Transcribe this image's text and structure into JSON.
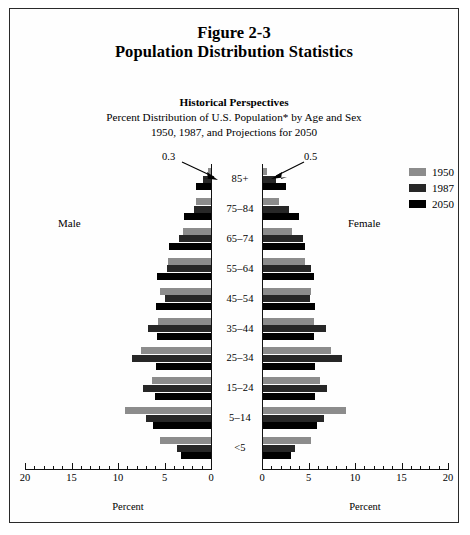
{
  "figure": {
    "title_line1": "Figure 2-3",
    "title_line2": "Population Distribution Statistics",
    "subtitle_strong": "Historical Perspectives",
    "subtitle_line2": "Percent Distribution of U.S. Population* by Age and Sex",
    "subtitle_line3": "1950, 1987, and Projections for 2050"
  },
  "labels": {
    "male": "Male",
    "female": "Female",
    "xaxis_left": "Percent",
    "xaxis_right": "Percent"
  },
  "legend": {
    "items": [
      {
        "label": "1950",
        "color": "#8c8c8c"
      },
      {
        "label": "1987",
        "color": "#272727"
      },
      {
        "label": "2050",
        "color": "#000000"
      }
    ]
  },
  "callouts": [
    {
      "name": "male-85plus-1950-value",
      "text": "0.3"
    },
    {
      "name": "female-85plus-1950-value",
      "text": "0.5"
    }
  ],
  "axis": {
    "tick_labels_left": [
      "20",
      "15",
      "10",
      "5",
      "0"
    ],
    "tick_labels_right": [
      "0",
      "5",
      "10",
      "15",
      "20"
    ],
    "major_ticks": [
      0,
      5,
      10,
      15,
      20
    ],
    "minor_step": 1,
    "max": 20
  },
  "chart_data": {
    "type": "bar",
    "subtype": "population-pyramid",
    "title": "Population Distribution Statistics",
    "subtitle": "Percent Distribution of U.S. Population* by Age and Sex — 1950, 1987, and Projections for 2050",
    "xlabel": "Percent",
    "ylabel": "",
    "xlim": [
      0,
      20
    ],
    "grid": false,
    "legend_position": "top-right",
    "categories": [
      "85+",
      "75–84",
      "65–74",
      "55–64",
      "45–54",
      "35–44",
      "25–34",
      "15–24",
      "5–14",
      "<5"
    ],
    "sides": [
      "Male",
      "Female"
    ],
    "series": [
      {
        "name": "1950",
        "color": "#8c8c8c",
        "male": [
          0.3,
          1.6,
          3.0,
          4.6,
          5.5,
          5.7,
          7.5,
          6.3,
          9.3,
          5.5
        ],
        "female": [
          0.5,
          1.8,
          3.2,
          4.6,
          5.3,
          5.6,
          7.4,
          6.2,
          9.0,
          5.3
        ]
      },
      {
        "name": "1987",
        "color": "#272727",
        "male": [
          0.9,
          1.8,
          3.4,
          4.7,
          4.9,
          6.8,
          8.5,
          7.3,
          7.0,
          3.7
        ],
        "female": [
          1.5,
          2.9,
          4.4,
          5.3,
          5.2,
          6.9,
          8.6,
          7.0,
          6.7,
          3.5
        ]
      },
      {
        "name": "2050",
        "color": "#000000",
        "male": [
          1.6,
          2.9,
          4.5,
          5.8,
          5.9,
          5.8,
          5.9,
          6.0,
          6.2,
          3.2
        ],
        "female": [
          2.6,
          4.0,
          4.6,
          5.6,
          5.7,
          5.6,
          5.7,
          5.7,
          5.9,
          3.1
        ]
      }
    ],
    "annotations": [
      {
        "text": "0.3",
        "target": "Male 85+ 1950"
      },
      {
        "text": "0.5",
        "target": "Female 85+ 1950"
      }
    ]
  }
}
